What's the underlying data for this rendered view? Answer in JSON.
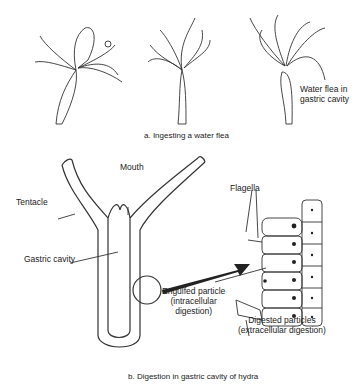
{
  "panel_a": {
    "caption": "a. Ingesting a water flea",
    "labels": {
      "water_flea_line1": "Water flea in",
      "water_flea_line2": "gastric cavity"
    }
  },
  "panel_b": {
    "caption": "b. Digestion in gastric cavity of hydra",
    "labels": {
      "mouth": "Mouth",
      "tentacle": "Tentacle",
      "gastric_cavity": "Gastric cavity",
      "flagella": "Flagella",
      "engulfed_line1": "Engulfed particle",
      "engulfed_line2": "(intracellular",
      "engulfed_line3": "digestion)",
      "digested_line1": "Digested particles",
      "digested_line2": "(extracellular digestion)"
    }
  }
}
